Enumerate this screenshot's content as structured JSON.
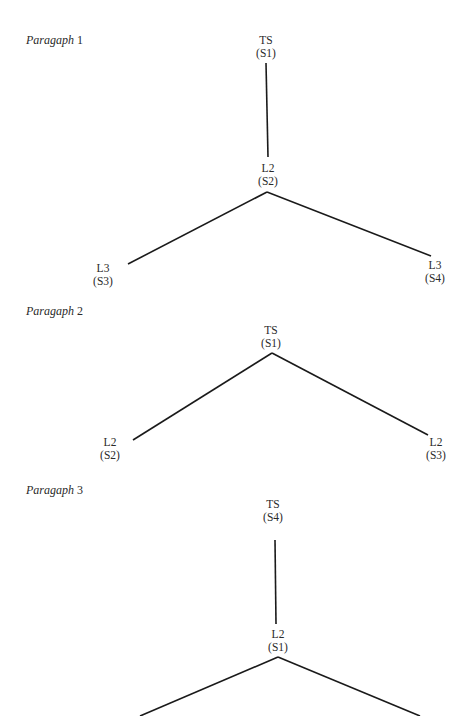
{
  "paragraphs": [
    {
      "label_word": "Paragaph",
      "label_num": "1",
      "nodes": [
        {
          "level": "TS",
          "sentence": "(S1)"
        },
        {
          "level": "L2",
          "sentence": "(S2)"
        },
        {
          "level": "L3",
          "sentence": "(S3)"
        },
        {
          "level": "L3",
          "sentence": "(S4)"
        }
      ]
    },
    {
      "label_word": "Paragaph",
      "label_num": "2",
      "nodes": [
        {
          "level": "TS",
          "sentence": "(S1)"
        },
        {
          "level": "L2",
          "sentence": "(S2)"
        },
        {
          "level": "L2",
          "sentence": "(S3)"
        }
      ]
    },
    {
      "label_word": "Paragaph",
      "label_num": "3",
      "nodes": [
        {
          "level": "TS",
          "sentence": "(S4)"
        },
        {
          "level": "L2",
          "sentence": "(S1)"
        }
      ]
    }
  ]
}
